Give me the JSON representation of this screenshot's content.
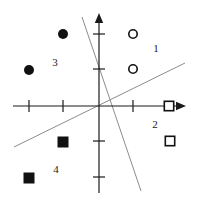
{
  "figure": {
    "width": 200,
    "height": 203,
    "background": "#ffffff",
    "axis_color": "#1a1a1a",
    "line_color": "#8c8c8c",
    "marker_fill_color": "#111111",
    "marker_stroke_color": "#111111"
  },
  "axes": {
    "origin": {
      "x": 99,
      "y": 106
    },
    "x_axis": {
      "x_start": 13,
      "x_end": 186,
      "y": 106,
      "arrow": "right",
      "label": ""
    },
    "y_axis": {
      "y_start": 13,
      "y_end": 193,
      "x": 99,
      "arrow": "up",
      "label": ""
    },
    "x_ticks": [
      {
        "x": 29,
        "label": ""
      },
      {
        "x": 63,
        "label": ""
      },
      {
        "x": 133,
        "label": ""
      }
    ],
    "y_ticks": [
      {
        "y": 34,
        "label": ""
      },
      {
        "y": 69,
        "label": ""
      },
      {
        "y": 141,
        "label": ""
      },
      {
        "y": 177,
        "label": ""
      }
    ],
    "tick_half_length": 6
  },
  "quadrant_labels": [
    {
      "id": "label-1",
      "text": "1",
      "x": 156,
      "y": 48
    },
    {
      "id": "label-2",
      "text": "2",
      "x": 155,
      "y": 124
    },
    {
      "id": "label-3",
      "text": "3",
      "x": 55,
      "y": 62
    },
    {
      "id": "label-4",
      "text": "4",
      "x": 56,
      "y": 169
    }
  ],
  "chart_data": {
    "type": "scatter",
    "title": "",
    "subtitle": "",
    "xlabel": "",
    "ylabel": "",
    "grid": false,
    "legend": "none",
    "axis_arrows": true,
    "xlim": [
      13,
      186
    ],
    "ylim": [
      13,
      193
    ],
    "series": [
      {
        "name": "filled-circle",
        "marker": "circle",
        "fill": "solid",
        "color": "#111111",
        "radius": 5,
        "points": [
          {
            "x": 29,
            "y": 70
          },
          {
            "x": 63,
            "y": 34
          }
        ]
      },
      {
        "name": "open-circle",
        "marker": "circle",
        "fill": "none",
        "color": "#111111",
        "radius": 5,
        "points": [
          {
            "x": 133,
            "y": 34
          },
          {
            "x": 133,
            "y": 69
          }
        ]
      },
      {
        "name": "filled-square",
        "marker": "square",
        "fill": "solid",
        "color": "#111111",
        "size": 11,
        "points": [
          {
            "x": 63,
            "y": 142
          },
          {
            "x": 29,
            "y": 178
          }
        ]
      },
      {
        "name": "open-square",
        "marker": "square",
        "fill": "none",
        "color": "#111111",
        "size": 11,
        "points": [
          {
            "x": 169,
            "y": 106
          },
          {
            "x": 170,
            "y": 141
          }
        ]
      }
    ],
    "lines": [
      {
        "name": "steep-descending-boundary",
        "x1": 82,
        "y1": 17,
        "x2": 141,
        "y2": 191,
        "color": "#8c8c8c",
        "width": 1
      },
      {
        "name": "shallow-ascending-boundary",
        "x1": 14,
        "y1": 147,
        "x2": 185,
        "y2": 63,
        "color": "#8c8c8c",
        "width": 1
      }
    ],
    "annotations": [
      {
        "text": "1",
        "x": 156,
        "y": 48
      },
      {
        "text": "2",
        "x": 155,
        "y": 124
      },
      {
        "text": "3",
        "x": 55,
        "y": 62
      },
      {
        "text": "4",
        "x": 56,
        "y": 169
      }
    ]
  }
}
